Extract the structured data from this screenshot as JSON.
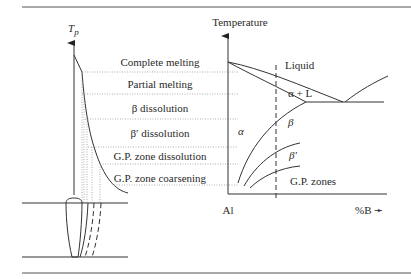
{
  "diagram": {
    "left_axis_label": "T",
    "left_axis_sub": "p",
    "right_axis_label": "Temperature",
    "zones": [
      "Complete melting",
      "Partial melting",
      "β dissolution",
      "β′ dissolution",
      "G.P. zone dissolution",
      "G.P. zone coarsening"
    ],
    "phase_labels": {
      "liquid": "Liquid",
      "alpha_plus_l": "α + L",
      "alpha": "α",
      "beta": "β",
      "beta_prime": "β′",
      "gp_zones": "G.P. zones"
    },
    "x_axis_left": "Al",
    "x_axis_right": "%B ➛"
  }
}
